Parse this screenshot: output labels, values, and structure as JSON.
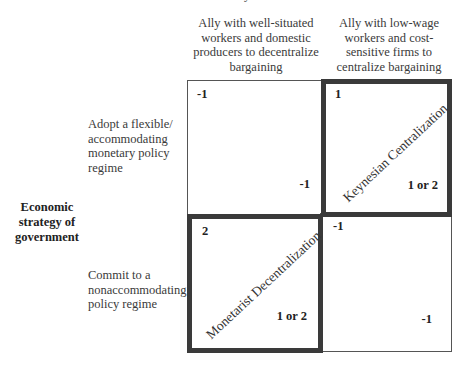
{
  "header": {
    "partial_top_text": "y"
  },
  "columns": [
    {
      "label": "Ally with well-situated workers and domestic producers to decentralize bargaining",
      "lines": [
        "Ally with well-situated",
        "workers and domestic",
        "producers to decentralize",
        "bargaining"
      ]
    },
    {
      "label": "Ally with low-wage workers and cost-sensitive firms to centralize bargaining",
      "lines": [
        "Ally with low-wage",
        "workers and cost-",
        "sensitive firms to",
        "centralize bargaining"
      ]
    }
  ],
  "row_axis_label": {
    "lines": [
      "Economic",
      "strategy of",
      "government"
    ]
  },
  "rows": [
    {
      "label": "Adopt a flexible/ accommodating monetary policy regime",
      "lines": [
        "Adopt a flexible/",
        "accommodating",
        "monetary policy",
        "regime"
      ]
    },
    {
      "label": "Commit to a nonaccommodating policy regime",
      "lines": [
        "Commit to a",
        "nonaccommodating",
        "policy regime"
      ]
    }
  ],
  "cells": [
    {
      "row": 0,
      "col": 0,
      "top_left_payoff": "-1",
      "bottom_right_payoff": "-1",
      "highlighted": false,
      "diagonal_label": ""
    },
    {
      "row": 0,
      "col": 1,
      "top_left_payoff": "1",
      "bottom_right_payoff": "1 or 2",
      "highlighted": true,
      "diagonal_label": "Keynesian Centralization"
    },
    {
      "row": 1,
      "col": 0,
      "top_left_payoff": "2",
      "bottom_right_payoff": "1 or 2",
      "highlighted": true,
      "diagonal_label": "Monetarist Decentralization"
    },
    {
      "row": 1,
      "col": 1,
      "top_left_payoff": "-1",
      "bottom_right_payoff": "-1",
      "highlighted": false,
      "diagonal_label": ""
    }
  ],
  "colors": {
    "highlight_border": "#3a3a3a",
    "thin_border": "#555555",
    "text": "#333333"
  }
}
